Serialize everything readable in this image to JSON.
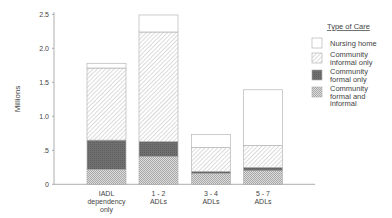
{
  "chart_data": {
    "type": "bar",
    "stacked": true,
    "title": "",
    "xlabel": "",
    "ylabel": "Millions",
    "ylim": [
      0,
      2.5
    ],
    "yticks": [
      0,
      0.5,
      1.0,
      1.5,
      2.0,
      2.5
    ],
    "ytick_labels": [
      "0",
      ".5",
      "1.0",
      "1.5",
      "2.0",
      "2.5"
    ],
    "grid": false,
    "categories": [
      [
        "IADL",
        "dependency",
        "only"
      ],
      [
        "1 - 2",
        "ADLs"
      ],
      [
        "3 - 4",
        "ADLs"
      ],
      [
        "5 - 7",
        "ADLs"
      ]
    ],
    "series": [
      {
        "name": "Community formal and informal",
        "legend_lines": [
          "Community",
          "formal and",
          "informal"
        ],
        "pattern": "crosshatch",
        "values": [
          0.22,
          0.41,
          0.16,
          0.2
        ]
      },
      {
        "name": "Community formal only",
        "legend_lines": [
          "Community",
          "formal only"
        ],
        "pattern": "dark",
        "values": [
          0.43,
          0.22,
          0.03,
          0.05
        ]
      },
      {
        "name": "Community informal only",
        "legend_lines": [
          "Community",
          "informal only"
        ],
        "pattern": "diagonal",
        "values": [
          1.06,
          1.61,
          0.35,
          0.32
        ]
      },
      {
        "name": "Nursing home",
        "legend_lines": [
          "Nursing home"
        ],
        "pattern": "blank",
        "values": [
          0.07,
          0.25,
          0.19,
          0.82
        ]
      }
    ],
    "legend": {
      "title": "Type of Care",
      "placement": "right",
      "order": [
        "Nursing home",
        "Community informal only",
        "Community formal only",
        "Community formal and informal"
      ]
    }
  }
}
